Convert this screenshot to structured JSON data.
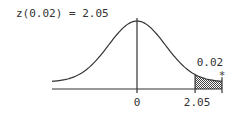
{
  "chart_data": {
    "type": "area",
    "title": "z(0.02) = 2.05",
    "distribution": "standard normal",
    "xlim": [
      -3.0,
      3.0
    ],
    "x_ticks": [
      {
        "value": 0,
        "label": "0"
      },
      {
        "value": 2.05,
        "label": "2.05"
      }
    ],
    "shaded_region": {
      "from": 2.05,
      "to": 3.0,
      "area_label": "0.02",
      "marker": "*"
    },
    "alpha": 0.02,
    "z_value": 2.05,
    "colors": {
      "line": "#333333",
      "shade": "#555555",
      "background": "#ffffff"
    }
  }
}
